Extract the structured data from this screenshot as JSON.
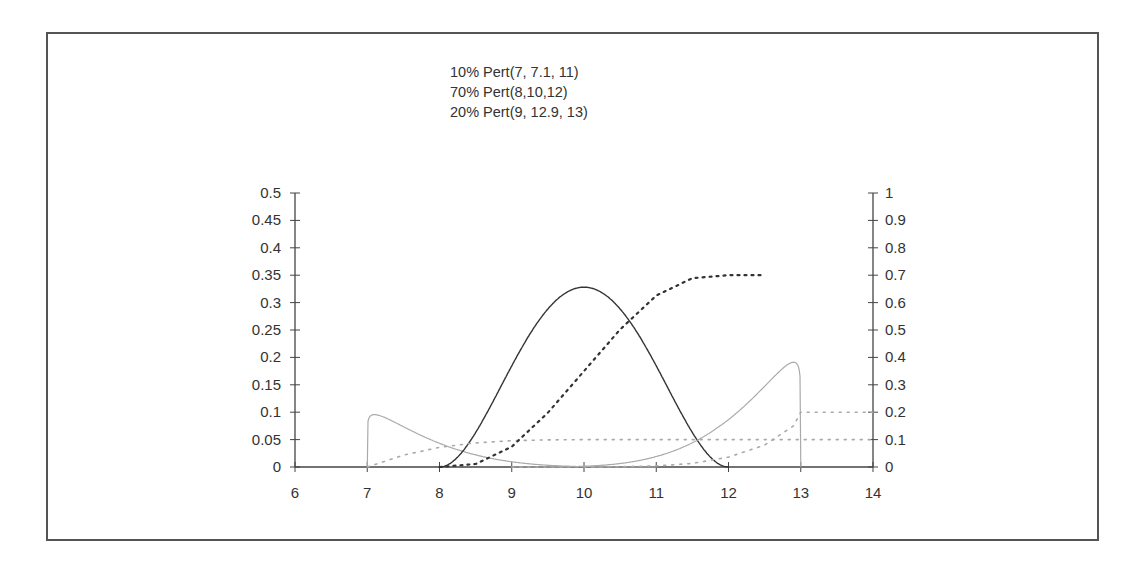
{
  "chart_data": {
    "type": "line",
    "title_lines": [
      "10% Pert(7, 7.1, 11)",
      "70% Pert(8,10,12)",
      "20% Pert(9, 12.9, 13)"
    ],
    "xlabel": "",
    "ylabel": "",
    "xlim": [
      6,
      14
    ],
    "ylim": [
      0,
      0.5
    ],
    "y2lim": [
      0,
      1
    ],
    "x_ticks": [
      "6",
      "7",
      "8",
      "9",
      "10",
      "11",
      "12",
      "13",
      "14"
    ],
    "y_ticks": [
      "0",
      "0.05",
      "0.1",
      "0.15",
      "0.2",
      "0.25",
      "0.3",
      "0.35",
      "0.4",
      "0.45",
      "0.5"
    ],
    "y2_ticks": [
      "0",
      "0.1",
      "0.2",
      "0.3",
      "0.4",
      "0.5",
      "0.6",
      "0.7",
      "0.8",
      "0.9",
      "1"
    ],
    "grid": false,
    "legend": "none",
    "series": [
      {
        "name": "10% Pert(7, 7.1, 11) density",
        "axis": "left",
        "style": "solid-light",
        "weight": 0.1,
        "pert": [
          7,
          7.1,
          11
        ],
        "x": [
          7,
          7.1,
          7.5,
          8,
          8.5,
          9,
          9.5,
          10,
          10.5,
          11
        ],
        "values": [
          0,
          0.096,
          0.074,
          0.043,
          0.022,
          0.0095,
          0.0033,
          0.0006,
          0.0001,
          0
        ]
      },
      {
        "name": "70% Pert(8,10,12) density",
        "axis": "left",
        "style": "solid-dark",
        "weight": 0.7,
        "pert": [
          8,
          10,
          12
        ],
        "x": [
          8,
          8.5,
          9,
          9.5,
          10,
          10.5,
          11,
          11.5,
          12
        ],
        "values": [
          0,
          0.063,
          0.185,
          0.288,
          0.328,
          0.288,
          0.185,
          0.063,
          0
        ]
      },
      {
        "name": "20% Pert(9, 12.9, 13) density",
        "axis": "left",
        "style": "solid-light",
        "weight": 0.2,
        "pert": [
          9,
          12.9,
          13
        ],
        "x": [
          9,
          9.5,
          10,
          10.5,
          11,
          11.5,
          12,
          12.5,
          12.9,
          13
        ],
        "values": [
          0,
          0.0002,
          0.0012,
          0.0067,
          0.019,
          0.044,
          0.087,
          0.147,
          0.191,
          0
        ]
      },
      {
        "name": "10% Pert(7, 7.1, 11) cumulative",
        "axis": "right",
        "style": "dotted-light",
        "x": [
          7,
          7.5,
          8,
          8.5,
          9,
          9.5,
          10,
          11,
          12,
          13,
          14
        ],
        "values": [
          0,
          0.043,
          0.072,
          0.088,
          0.096,
          0.099,
          0.1,
          0.1,
          0.1,
          0.1,
          0.1
        ]
      },
      {
        "name": "70% Pert(8,10,12) cumulative",
        "axis": "right",
        "style": "dotted-dark",
        "x": [
          8,
          8.5,
          9,
          9.5,
          10,
          10.5,
          11,
          11.5,
          12,
          12.5
        ],
        "values": [
          0,
          0.011,
          0.074,
          0.198,
          0.35,
          0.502,
          0.626,
          0.689,
          0.7,
          0.7
        ]
      },
      {
        "name": "20% Pert(9, 12.9, 13) cumulative",
        "axis": "right",
        "style": "dotted-light",
        "x": [
          9,
          10,
          10.5,
          11,
          11.5,
          12,
          12.5,
          12.9,
          13,
          14
        ],
        "values": [
          0,
          0.0001,
          0.001,
          0.004,
          0.013,
          0.036,
          0.08,
          0.15,
          0.2,
          0.2
        ]
      }
    ],
    "colors": {
      "axis": "#444444",
      "dark": "#333333",
      "light": "#aaaaaa",
      "text": "#333333",
      "border": "#555555"
    }
  }
}
